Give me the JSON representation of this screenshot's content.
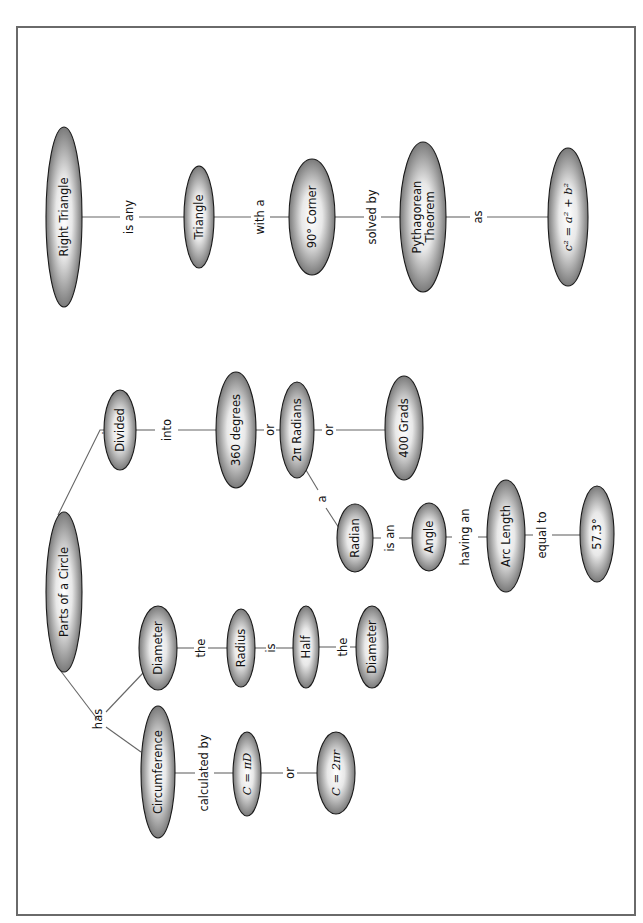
{
  "diagram": {
    "type": "concept-map",
    "orientation": "rotated-90-ccw",
    "frame_color": "#6a6a6a",
    "node_gradient": {
      "edge": "#7a7a7a",
      "center": "#ffffff"
    },
    "maps": [
      {
        "root": "Parts of a Circle",
        "branches": [
          {
            "link": "is",
            "chain": [
              "Divided",
              "into",
              "360 degrees",
              "or",
              "2π Radians",
              "or",
              "400 Grads"
            ],
            "sub": {
              "from": "2π Radians",
              "link": "a",
              "chain": [
                "Radian",
                "is an",
                "Angle",
                "having an",
                "Arc Length",
                "equal to",
                "57.3°"
              ]
            }
          },
          {
            "link": "has",
            "children": [
              {
                "chain": [
                  "Diameter",
                  "the",
                  "Radius",
                  "is",
                  "Half",
                  "the",
                  "Diameter"
                ]
              },
              {
                "chain": [
                  "Circumference",
                  "calculated by",
                  "C = πD",
                  "or",
                  "C = 2πr"
                ]
              }
            ]
          }
        ]
      },
      {
        "root": "Right Triangle",
        "chain": [
          "Right Triangle",
          "is any",
          "Triangle",
          "with a",
          "90° Corner",
          "solved by",
          "Pythagorean Theorem",
          "as",
          "c² = a² + b²"
        ]
      }
    ]
  },
  "nodes": {
    "parts_of_circle": "Parts of a Circle",
    "divided": "Divided",
    "deg360": "360 degrees",
    "radians2pi": "2π Radians",
    "grads400": "400 Grads",
    "radian": "Radian",
    "angle": "Angle",
    "arc_length": "Arc Length",
    "deg573": "57.3°",
    "diameter1": "Diameter",
    "radius": "Radius",
    "half": "Half",
    "diameter2": "Diameter",
    "circumference": "Circumference",
    "c_pi_d": "C = πD",
    "c_2pi_r": "C = 2πr",
    "right_triangle": "Right Triangle",
    "triangle": "Triangle",
    "corner90": "90° Corner",
    "pythagorean_l1": "Pythagorean",
    "pythagorean_l2": "Theorem",
    "pyth_formula": "c² = a² + b²"
  },
  "links": {
    "is": "is",
    "into": "into",
    "or1": "or",
    "or2": "or",
    "a": "a",
    "is_an": "is an",
    "having_an": "having an",
    "equal_to": "equal to",
    "has": "has",
    "the1": "the",
    "is2": "is",
    "the2": "the",
    "calculated_by": "calculated by",
    "or3": "or",
    "is_any": "is any",
    "with_a": "with a",
    "solved_by": "solved by",
    "as": "as"
  }
}
